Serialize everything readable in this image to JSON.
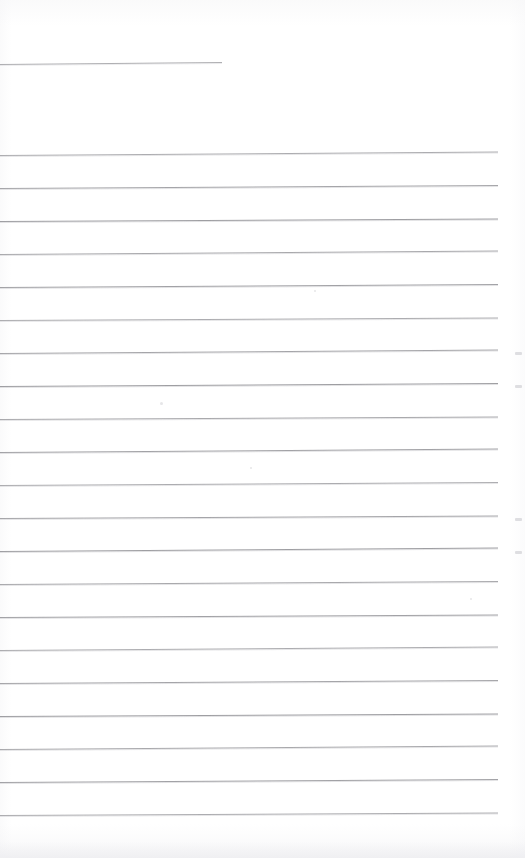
{
  "document": {
    "kind": "scanned-page",
    "description": "Blank ruled notebook page, scanned",
    "page_width": 525,
    "page_height": 858,
    "background_color": "#ffffff",
    "rule_color": "#9b9b9f",
    "content_text": "",
    "writing_present": "none"
  },
  "ruling": {
    "line_count": 21,
    "line_spacing_px": 33,
    "first_line_y": 155,
    "last_line_y": 815,
    "line_left_x": 0,
    "line_right_x": 498,
    "skew_degrees": -0.35,
    "thickness_px": 1
  },
  "header_rule": {
    "label": "short-header-rule",
    "y": 64,
    "left_x": 0,
    "right_x": 222,
    "skew_degrees": -0.5
  },
  "margins": {
    "top_blank_px": 155,
    "bottom_blank_px": 43,
    "right_blank_px": 27
  },
  "artifacts": {
    "edge_marks_y": [
      352,
      385,
      518,
      551
    ],
    "edge_mark_x": 515,
    "fleck_positions": [
      {
        "x": 160,
        "y": 402,
        "size": 3
      },
      {
        "x": 250,
        "y": 467,
        "size": 2
      },
      {
        "x": 314,
        "y": 290,
        "size": 2
      },
      {
        "x": 470,
        "y": 598,
        "size": 2
      }
    ]
  }
}
